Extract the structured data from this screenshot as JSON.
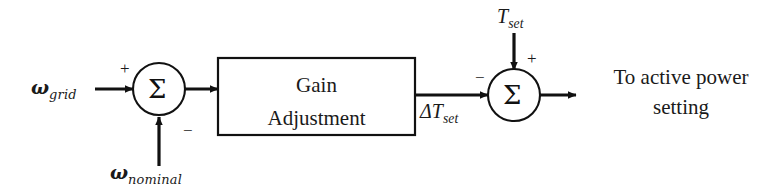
{
  "diagram": {
    "type": "control-block-diagram",
    "stroke_color": "#111111",
    "background_color": "#ffffff"
  },
  "inputs": {
    "grid_frequency": {
      "symbol": "ω",
      "subscript": "grid",
      "sign": "+"
    },
    "nominal_frequency": {
      "symbol": "ω",
      "subscript": "nominal",
      "sign": "−"
    },
    "torque_setpoint": {
      "symbol": "T",
      "subscript": "set",
      "sign": "+"
    }
  },
  "signals": {
    "delta_torque": {
      "symbol": "ΔT",
      "subscript": "set",
      "sign": "−"
    }
  },
  "blocks": {
    "gain_adjustment": {
      "line1": "Gain",
      "line2": "Adjustment"
    },
    "summing_junction_1": {
      "glyph": "Σ",
      "plus": "+",
      "minus": "−"
    },
    "summing_junction_2": {
      "glyph": "Σ",
      "plus": "+",
      "minus": "−"
    }
  },
  "output": {
    "line1": "To active power",
    "line2": "setting"
  }
}
